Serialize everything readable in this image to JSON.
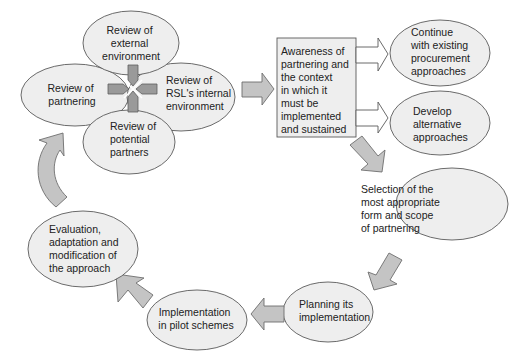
{
  "diagram": {
    "type": "process-cycle",
    "colors": {
      "node_fill": "#eeeeee",
      "node_stroke": "#5a5a5a",
      "arrow_fill": "#c4c4c4",
      "cross_fill": "#9a9a9a",
      "hollow_arrow_fill": "#ffffff"
    },
    "review_cluster": {
      "external": [
        "Review of",
        "external",
        "environment"
      ],
      "partnering": [
        "Review of",
        "partnering"
      ],
      "internal": [
        "Review of",
        "RSL's internal",
        "environment"
      ],
      "partners": [
        "Review of",
        "potential",
        "partners"
      ]
    },
    "awareness_box": [
      "Awareness of",
      "partnering and",
      "the context",
      "in which it",
      "must be",
      "implemented",
      "and sustained"
    ],
    "outcomes": {
      "continue": [
        "Continue",
        "with existing",
        "procurement",
        "approaches"
      ],
      "develop": [
        "Develop",
        "alternative",
        "approaches"
      ]
    },
    "cycle": {
      "selection": [
        "Selection of the",
        "most appropriate",
        "form and scope",
        "of partnering"
      ],
      "planning": [
        "Planning its",
        "implementation"
      ],
      "pilot": [
        "Implementation",
        "in pilot schemes"
      ],
      "evaluation": [
        "Evaluation,",
        "adaptation and",
        "modification of",
        "the approach"
      ]
    }
  }
}
